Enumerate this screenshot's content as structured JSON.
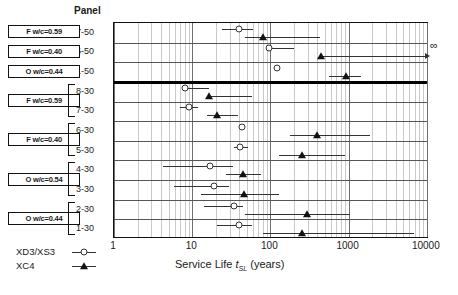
{
  "panel_header": "Panel",
  "axis": {
    "xlabel_pre": "Service Life ",
    "xlabel_var": "t",
    "xlabel_sub": "SL",
    "xlabel_post": " (years)",
    "xticks": [
      "1",
      "10",
      "100",
      "1000",
      "10000"
    ],
    "infinity_symbol": "∞"
  },
  "legend": {
    "items": [
      {
        "label": "XD3/XS3",
        "marker": "open-circle"
      },
      {
        "label": "XC4",
        "marker": "filled-triangle"
      }
    ]
  },
  "groups": [
    {
      "label": "F w/c=0.59",
      "panels": [
        "7-50"
      ]
    },
    {
      "label": "F w/c=0.40",
      "panels": [
        "5-50"
      ]
    },
    {
      "label": "O w/c=0.44",
      "panels": [
        "1-50"
      ]
    },
    {
      "label": "F w/c=0.59",
      "panels": [
        "8-30",
        "7-30"
      ]
    },
    {
      "label": "F w/c=0.40",
      "panels": [
        "6-30",
        "5-30"
      ]
    },
    {
      "label": "O w/c=0.54",
      "panels": [
        "4-30",
        "3-30"
      ]
    },
    {
      "label": "O w/c=0.44",
      "panels": [
        "2-30",
        "1-30"
      ]
    }
  ],
  "chart_data": {
    "type": "scatter",
    "title": "",
    "xlabel": "Service Life t_SL (years)",
    "ylabel": "Panel",
    "xscale": "log",
    "xlim": [
      1,
      20000
    ],
    "grid": true,
    "legend_position": "bottom-left",
    "series": [
      {
        "name": "XD3/XS3",
        "marker": "open-circle"
      },
      {
        "name": "XC4",
        "marker": "filled-triangle"
      }
    ],
    "categories": [
      "7-50",
      "5-50",
      "1-50",
      "8-30",
      "7-30",
      "6-30",
      "5-30",
      "4-30",
      "3-30",
      "2-30",
      "1-30"
    ],
    "points": [
      {
        "panel": "7-50",
        "series": "XD3/XS3",
        "value": 40,
        "low": 24,
        "high": 60,
        "censored": false
      },
      {
        "panel": "7-50",
        "series": "XC4",
        "value": 80,
        "low": 48,
        "high": 430,
        "censored": false
      },
      {
        "panel": "5-50",
        "series": "XD3/XS3",
        "value": 95,
        "low": 95,
        "high": 200,
        "censored": false
      },
      {
        "panel": "5-50",
        "series": "XC4",
        "value": 440,
        "low": 440,
        "high": 20000,
        "censored": true
      },
      {
        "panel": "1-50",
        "series": "XD3/XS3",
        "value": 120,
        "low": 120,
        "high": 120,
        "censored": false
      },
      {
        "panel": "1-50",
        "series": "XC4",
        "value": 940,
        "low": 560,
        "high": 1450,
        "censored": false
      },
      {
        "panel": "8-30",
        "series": "XD3/XS3",
        "value": 8.0,
        "low": 8.0,
        "high": 16.5,
        "censored": false
      },
      {
        "panel": "8-30",
        "series": "XC4",
        "value": 16.5,
        "low": 16.5,
        "high": 58,
        "censored": false
      },
      {
        "panel": "7-30",
        "series": "XD3/XS3",
        "value": 9.0,
        "low": 7.0,
        "high": 12.0,
        "censored": false
      },
      {
        "panel": "7-30",
        "series": "XC4",
        "value": 21,
        "low": 15.5,
        "high": 38,
        "censored": false
      },
      {
        "panel": "6-30",
        "series": "XD3/XS3",
        "value": 43,
        "low": 43,
        "high": 43,
        "censored": false
      },
      {
        "panel": "6-30",
        "series": "XC4",
        "value": 400,
        "low": 180,
        "high": 1900,
        "censored": false
      },
      {
        "panel": "5-30",
        "series": "XD3/XS3",
        "value": 41,
        "low": 34,
        "high": 52,
        "censored": false
      },
      {
        "panel": "5-30",
        "series": "XC4",
        "value": 250,
        "low": 130,
        "high": 900,
        "censored": false
      },
      {
        "panel": "4-30",
        "series": "XD3/XS3",
        "value": 17,
        "low": 4.2,
        "high": 33,
        "censored": false
      },
      {
        "panel": "4-30",
        "series": "XC4",
        "value": 45,
        "low": 27,
        "high": 75,
        "censored": false
      },
      {
        "panel": "3-30",
        "series": "XD3/XS3",
        "value": 19,
        "low": 5.8,
        "high": 30,
        "censored": false
      },
      {
        "panel": "3-30",
        "series": "XC4",
        "value": 46,
        "low": 13,
        "high": 130,
        "censored": false
      },
      {
        "panel": "2-30",
        "series": "XD3/XS3",
        "value": 34,
        "low": 14,
        "high": 45,
        "censored": false
      },
      {
        "panel": "2-30",
        "series": "XC4",
        "value": 290,
        "low": 48,
        "high": 1050,
        "censored": false
      },
      {
        "panel": "1-30",
        "series": "XD3/XS3",
        "value": 40,
        "low": 21,
        "high": 59,
        "censored": false
      },
      {
        "panel": "1-30",
        "series": "XC4",
        "value": 250,
        "low": 80,
        "high": 6800,
        "censored": false
      }
    ]
  }
}
